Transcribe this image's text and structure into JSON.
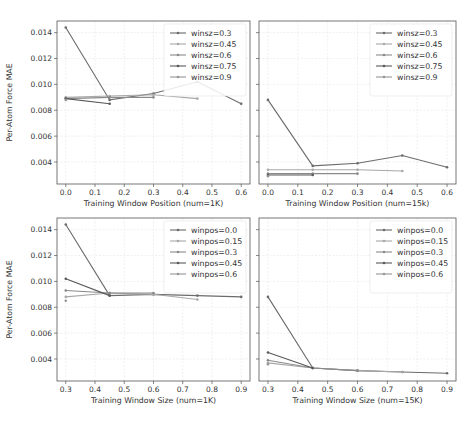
{
  "chart_data": [
    {
      "type": "line",
      "id": "top-left",
      "xlabel": "Training Window Position (num=1K)",
      "ylabel": "Per-Atom Force MAE",
      "xticks": [
        0.0,
        0.1,
        0.2,
        0.3,
        0.4,
        0.5,
        0.6
      ],
      "yticks": [
        0.004,
        0.006,
        0.008,
        0.01,
        0.012,
        0.014
      ],
      "xlim": [
        -0.03,
        0.63
      ],
      "ylim": [
        0.0023,
        0.0149
      ],
      "show_yticklabels": true,
      "grid": true,
      "legend_position": "upper right",
      "x": [
        0.0,
        0.15,
        0.3,
        0.45,
        0.6
      ],
      "series": [
        {
          "name": "winsz=0.3",
          "color": "#6b6b6b",
          "values": [
            0.0144,
            0.0088,
            0.0093,
            0.0102,
            0.0085
          ]
        },
        {
          "name": "winsz=0.45",
          "color": "#a8a8a8",
          "values": [
            0.009,
            0.0091,
            0.0092,
            0.0089
          ]
        },
        {
          "name": "winsz=0.6",
          "color": "#8a8a8a",
          "values": [
            0.0089,
            0.009,
            0.009
          ]
        },
        {
          "name": "winsz=0.75",
          "color": "#5a5a5a",
          "values": [
            0.0089,
            0.0085
          ]
        },
        {
          "name": "winsz=0.9",
          "color": "#969696",
          "values": [
            0.0088
          ]
        }
      ]
    },
    {
      "type": "line",
      "id": "top-right",
      "xlabel": "Training Window Position (num=15k)",
      "ylabel": "",
      "xticks": [
        0.0,
        0.1,
        0.2,
        0.3,
        0.4,
        0.5,
        0.6
      ],
      "yticks": [
        0.004,
        0.006,
        0.008,
        0.01,
        0.012,
        0.014
      ],
      "xlim": [
        -0.03,
        0.63
      ],
      "ylim": [
        0.0023,
        0.0149
      ],
      "show_yticklabels": false,
      "grid": true,
      "legend_position": "upper right",
      "x": [
        0.0,
        0.15,
        0.3,
        0.45,
        0.6
      ],
      "series": [
        {
          "name": "winsz=0.3",
          "color": "#6b6b6b",
          "values": [
            0.0088,
            0.0037,
            0.0039,
            0.0045,
            0.0036
          ]
        },
        {
          "name": "winsz=0.45",
          "color": "#a8a8a8",
          "values": [
            0.0034,
            0.0034,
            0.0034,
            0.0033
          ]
        },
        {
          "name": "winsz=0.6",
          "color": "#8a8a8a",
          "values": [
            0.0031,
            0.0031,
            0.0031
          ]
        },
        {
          "name": "winsz=0.75",
          "color": "#5a5a5a",
          "values": [
            0.003,
            0.003
          ]
        },
        {
          "name": "winsz=0.9",
          "color": "#969696",
          "values": [
            0.0029
          ]
        }
      ]
    },
    {
      "type": "line",
      "id": "bottom-left",
      "xlabel": "Training Window Size (num=1K)",
      "ylabel": "Per-Atom Force MAE",
      "xticks": [
        0.3,
        0.4,
        0.5,
        0.6,
        0.7,
        0.8,
        0.9
      ],
      "yticks": [
        0.004,
        0.006,
        0.008,
        0.01,
        0.012,
        0.014
      ],
      "xlim": [
        0.27,
        0.93
      ],
      "ylim": [
        0.0023,
        0.0149
      ],
      "show_yticklabels": true,
      "grid": true,
      "legend_position": "upper right",
      "x": [
        0.3,
        0.45,
        0.6,
        0.75,
        0.9
      ],
      "series": [
        {
          "name": "winpos=0.0",
          "color": "#6b6b6b",
          "values": [
            0.0144,
            0.0089,
            0.009,
            0.0089,
            0.0088
          ]
        },
        {
          "name": "winpos=0.15",
          "color": "#a8a8a8",
          "values": [
            0.0088,
            0.0091,
            0.009,
            0.0086
          ]
        },
        {
          "name": "winpos=0.3",
          "color": "#8a8a8a",
          "values": [
            0.0093,
            0.0091,
            0.0091
          ]
        },
        {
          "name": "winpos=0.45",
          "color": "#5a5a5a",
          "values": [
            0.0102,
            0.0089
          ]
        },
        {
          "name": "winpos=0.6",
          "color": "#969696",
          "values": [
            0.0085
          ]
        }
      ]
    },
    {
      "type": "line",
      "id": "bottom-right",
      "xlabel": "Training Window Size (num=15K)",
      "ylabel": "",
      "xticks": [
        0.3,
        0.4,
        0.5,
        0.6,
        0.7,
        0.8,
        0.9
      ],
      "yticks": [
        0.004,
        0.006,
        0.008,
        0.01,
        0.012,
        0.014
      ],
      "xlim": [
        0.27,
        0.93
      ],
      "ylim": [
        0.0023,
        0.0149
      ],
      "show_yticklabels": false,
      "grid": true,
      "legend_position": "upper right",
      "x": [
        0.3,
        0.45,
        0.6,
        0.75,
        0.9
      ],
      "series": [
        {
          "name": "winpos=0.0",
          "color": "#6b6b6b",
          "values": [
            0.0088,
            0.0033,
            0.0031,
            0.003,
            0.0029
          ]
        },
        {
          "name": "winpos=0.15",
          "color": "#a8a8a8",
          "values": [
            0.0037,
            0.0033,
            0.0031,
            0.003
          ]
        },
        {
          "name": "winpos=0.3",
          "color": "#8a8a8a",
          "values": [
            0.0039,
            0.0033,
            0.0031
          ]
        },
        {
          "name": "winpos=0.45",
          "color": "#5a5a5a",
          "values": [
            0.0045,
            0.0033
          ]
        },
        {
          "name": "winpos=0.6",
          "color": "#969696",
          "values": [
            0.0036
          ]
        }
      ]
    }
  ],
  "layout": {
    "panels": [
      {
        "left": 57,
        "top": 21,
        "width": 193,
        "height": 163
      },
      {
        "left": 259,
        "top": 21,
        "width": 197,
        "height": 163
      },
      {
        "left": 57,
        "top": 218,
        "width": 193,
        "height": 163
      },
      {
        "left": 259,
        "top": 218,
        "width": 197,
        "height": 163
      }
    ],
    "axis_color": "#555555",
    "grid_color": "#e6e6e6"
  }
}
